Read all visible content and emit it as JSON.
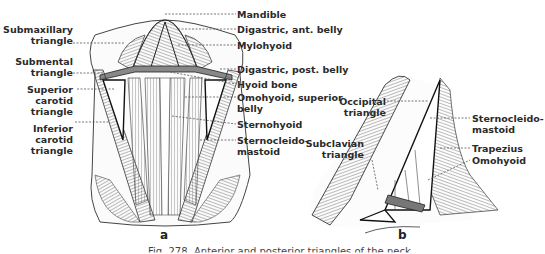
{
  "figure": {
    "panel_a": {
      "letter": "a",
      "left_labels": [
        {
          "line1": "Submaxillary",
          "line2": "triangle"
        },
        {
          "line1": "Submental",
          "line2": "triangle"
        },
        {
          "line1": "Superior",
          "line2": "carotid",
          "line3": "triangle"
        },
        {
          "line1": "Inferior",
          "line2": "carotid",
          "line3": "triangle"
        }
      ],
      "right_labels": [
        {
          "line1": "Mandible"
        },
        {
          "line1": "Digastric, ant. belly"
        },
        {
          "line1": "Mylohyoid"
        },
        {
          "line1": "Digastric, post. belly"
        },
        {
          "line1": "Hyoid bone"
        },
        {
          "line1": "Omohyoid, superior",
          "line2": "belly"
        },
        {
          "line1": "Sternohyoid"
        },
        {
          "line1": "Sternocleido-",
          "line2": "mastoid"
        }
      ]
    },
    "panel_b": {
      "letter": "b",
      "left_labels": [
        {
          "line1": "Occipital",
          "line2": "triangle"
        },
        {
          "line1": "Subclavian",
          "line2": "triangle"
        }
      ],
      "right_labels": [
        {
          "line1": "Sternocleido-",
          "line2": "mastoid"
        },
        {
          "line1": "Trapezius"
        },
        {
          "line1": "Omohyoid"
        }
      ]
    },
    "caption": "Fig. 278. Anterior and posterior triangles of the neck."
  }
}
